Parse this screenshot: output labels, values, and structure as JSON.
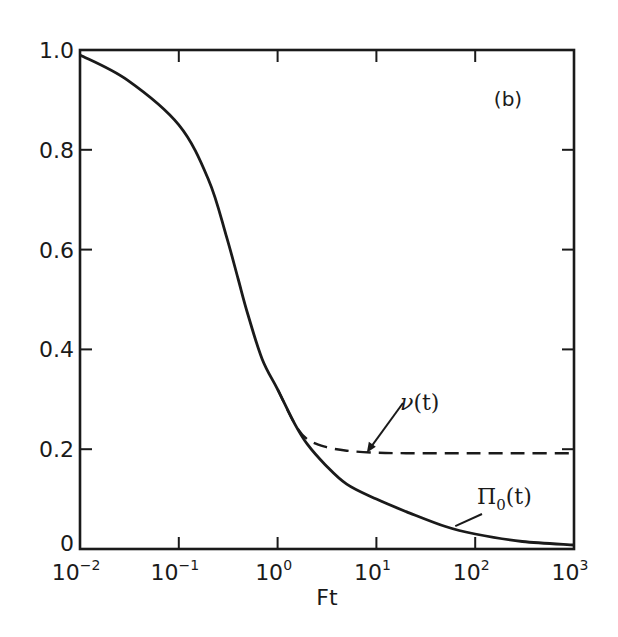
{
  "chart_data": {
    "type": "line",
    "title": "",
    "panel_label": "(b)",
    "xlabel": "Ft",
    "ylabel": "",
    "xscale": "log",
    "xlim": [
      0.01,
      1000
    ],
    "ylim": [
      0,
      1.0
    ],
    "grid": false,
    "legend": null,
    "x_ticks": [
      {
        "base": "10",
        "exp": "-2",
        "value": 0.01
      },
      {
        "base": "10",
        "exp": "-1",
        "value": 0.1
      },
      {
        "base": "10",
        "exp": "0",
        "value": 1
      },
      {
        "base": "10",
        "exp": "1",
        "value": 10
      },
      {
        "base": "10",
        "exp": "2",
        "value": 100
      },
      {
        "base": "10",
        "exp": "3",
        "value": 1000
      }
    ],
    "y_ticks": [
      {
        "label": "0",
        "value": 0
      },
      {
        "label": "0.2",
        "value": 0.2
      },
      {
        "label": "0.4",
        "value": 0.4
      },
      {
        "label": "0.6",
        "value": 0.6
      },
      {
        "label": "0.8",
        "value": 0.8
      },
      {
        "label": "1.0",
        "value": 1.0
      }
    ],
    "series": [
      {
        "name": "Π0(t)",
        "label_base": "Π",
        "label_sub": "0",
        "label_tail": "(t)",
        "style": "solid",
        "x": [
          0.01,
          0.03,
          0.1,
          0.2,
          0.3,
          0.4,
          0.5,
          0.7,
          1.0,
          1.5,
          2.0,
          3.0,
          5.0,
          10,
          20,
          50,
          100,
          300,
          1000
        ],
        "y": [
          0.99,
          0.94,
          0.85,
          0.74,
          0.63,
          0.54,
          0.47,
          0.38,
          0.32,
          0.25,
          0.21,
          0.17,
          0.13,
          0.1,
          0.075,
          0.045,
          0.03,
          0.015,
          0.008
        ]
      },
      {
        "name": "ν(t)",
        "label_base": "ν",
        "label_tail": "(t)",
        "style": "dashed",
        "x": [
          1.0,
          1.5,
          2.0,
          3.0,
          5.0,
          10,
          20,
          50,
          100,
          300,
          1000
        ],
        "y": [
          0.32,
          0.25,
          0.22,
          0.205,
          0.197,
          0.193,
          0.192,
          0.192,
          0.192,
          0.192,
          0.192
        ]
      }
    ],
    "annotations": [
      {
        "text": "ν(t)",
        "arrow_to": {
          "x": 8,
          "y": 0.193
        }
      },
      {
        "text": "Π0(t)",
        "arrow_to": {
          "x": 60,
          "y": 0.04
        }
      }
    ]
  }
}
